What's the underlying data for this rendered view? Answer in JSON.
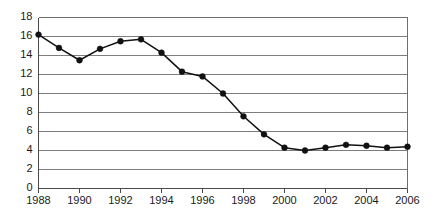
{
  "chart_data": {
    "type": "line",
    "title": "",
    "subtitle": "",
    "xlabel": "",
    "ylabel": "",
    "x": [
      1988,
      1989,
      1990,
      1991,
      1992,
      1993,
      1994,
      1995,
      1996,
      1997,
      1998,
      1999,
      2000,
      2001,
      2002,
      2003,
      2004,
      2005,
      2006
    ],
    "values": [
      16.2,
      14.8,
      13.5,
      14.7,
      15.5,
      15.7,
      14.3,
      12.3,
      11.8,
      10.0,
      7.6,
      5.7,
      4.3,
      4.0,
      4.3,
      4.6,
      4.5,
      4.3,
      4.4
    ],
    "series": [
      {
        "name": "",
        "values": [
          16.2,
          14.8,
          13.5,
          14.7,
          15.5,
          15.7,
          14.3,
          12.3,
          11.8,
          10.0,
          7.6,
          5.7,
          4.3,
          4.0,
          4.3,
          4.6,
          4.5,
          4.3,
          4.4
        ]
      }
    ],
    "xlim": [
      1988,
      2006
    ],
    "ylim": [
      0,
      18
    ],
    "y_ticks": [
      0,
      2,
      4,
      6,
      8,
      10,
      12,
      14,
      16,
      18
    ],
    "y_tick_labels": [
      "0",
      "2",
      "4",
      "6",
      "8",
      "10",
      "12",
      "14",
      "16",
      "18"
    ],
    "x_ticks": [
      1988,
      1990,
      1992,
      1994,
      1996,
      1998,
      2000,
      2002,
      2004,
      2006
    ],
    "x_tick_labels": [
      "1988",
      "1990",
      "1992",
      "1994",
      "1996",
      "1998",
      "2000",
      "2002",
      "2004",
      "2006"
    ],
    "grid": "horizontal",
    "legend": "none",
    "marker": "filled-circle",
    "line_color": "#111111",
    "marker_color": "#111111",
    "grid_color": "#7d7d7d",
    "axis_color": "#4a4a4a",
    "background_color": "#ffffff"
  }
}
